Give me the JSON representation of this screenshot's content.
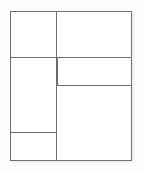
{
  "canvas": {
    "width": 144,
    "height": 171,
    "background_color": "#fefefe",
    "description": "Empty page-layout wireframe diagram"
  },
  "style": {
    "border_color": "#6e6e6e",
    "fill_color": "#ffffff",
    "shadow_color": "#f2f2f2",
    "border_width_px": 1
  },
  "wireframe": {
    "outer_bounds": {
      "left": 10,
      "top": 11,
      "right": 132,
      "bottom": 161
    },
    "column_divider_x": 56,
    "regions": [
      {
        "id": "left-top",
        "label": "",
        "column": "left",
        "order": 1,
        "x": 10,
        "y": 11,
        "width": 47,
        "height": 47
      },
      {
        "id": "left-middle",
        "label": "",
        "column": "left",
        "order": 2,
        "x": 10,
        "y": 57,
        "width": 47,
        "height": 76
      },
      {
        "id": "left-bottom",
        "label": "",
        "column": "left",
        "order": 3,
        "x": 10,
        "y": 132,
        "width": 47,
        "height": 29
      },
      {
        "id": "right-top",
        "label": "",
        "column": "right",
        "order": 1,
        "x": 56,
        "y": 11,
        "width": 76,
        "height": 47
      },
      {
        "id": "right-middle",
        "label": "",
        "column": "right",
        "order": 2,
        "x": 57,
        "y": 57,
        "width": 75,
        "height": 29
      },
      {
        "id": "right-bottom",
        "label": "",
        "column": "right",
        "order": 3,
        "x": 56,
        "y": 85,
        "width": 76,
        "height": 76
      }
    ]
  }
}
